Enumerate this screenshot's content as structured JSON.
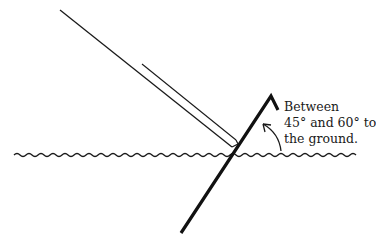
{
  "diagram": {
    "caption": {
      "line1": "Between",
      "line2": "45° and 60° to",
      "line3": "the ground."
    },
    "colors": {
      "ink": "#111111",
      "background": "#ffffff"
    },
    "elements": {
      "ground": "wavy-ground-line",
      "stake": "thick-angled-stake",
      "guy_line": "double-parallel-line",
      "angle_arrow": "curved-arrow"
    }
  }
}
